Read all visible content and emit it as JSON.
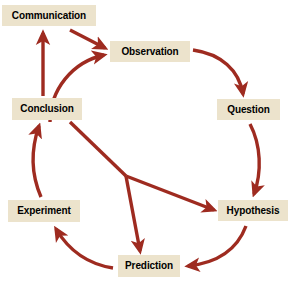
{
  "diagram": {
    "type": "cycle-flow-diagram",
    "canvas": {
      "width": 291,
      "height": 288
    },
    "colors": {
      "background": "#ffffff",
      "node_fill": "#ece3cc",
      "node_text": "#000000",
      "arrow": "#9e2b20"
    },
    "nodes": [
      {
        "id": "communication",
        "label": "Communication",
        "x": 2,
        "y": 5,
        "width": 94,
        "height": 21
      },
      {
        "id": "observation",
        "label": "Observation",
        "x": 110,
        "y": 41,
        "width": 80,
        "height": 21
      },
      {
        "id": "question",
        "label": "Question",
        "x": 217,
        "y": 99,
        "width": 63,
        "height": 21
      },
      {
        "id": "hypothesis",
        "label": "Hypothesis",
        "x": 218,
        "y": 200,
        "width": 70,
        "height": 21
      },
      {
        "id": "prediction",
        "label": "Prediction",
        "x": 118,
        "y": 255,
        "width": 62,
        "height": 22
      },
      {
        "id": "experiment",
        "label": "Experiment",
        "x": 8,
        "y": 200,
        "width": 72,
        "height": 22
      },
      {
        "id": "conclusion",
        "label": "Conclusion",
        "x": 12,
        "y": 98,
        "width": 70,
        "height": 22
      }
    ],
    "edges": [
      {
        "id": "conclusion-to-communication",
        "from": "Conclusion",
        "to": "Communication",
        "style": "straight"
      },
      {
        "id": "communication-to-observation",
        "from": "Communication",
        "to": "Observation",
        "style": "straight"
      },
      {
        "id": "conclusion-to-observation",
        "from": "Conclusion",
        "to": "Observation",
        "style": "curved"
      },
      {
        "id": "observation-to-question",
        "from": "Observation",
        "to": "Question",
        "style": "curved"
      },
      {
        "id": "question-to-hypothesis",
        "from": "Question",
        "to": "Hypothesis",
        "style": "curved"
      },
      {
        "id": "hypothesis-to-prediction",
        "from": "Hypothesis",
        "to": "Prediction",
        "style": "curved"
      },
      {
        "id": "prediction-to-experiment",
        "from": "Prediction",
        "to": "Experiment",
        "style": "curved"
      },
      {
        "id": "experiment-to-conclusion",
        "from": "Experiment",
        "to": "Conclusion",
        "style": "curved"
      },
      {
        "id": "conclusion-to-hypothesis",
        "from": "Conclusion",
        "to": "Hypothesis",
        "style": "branched"
      },
      {
        "id": "conclusion-to-prediction",
        "from": "Conclusion",
        "to": "Prediction",
        "style": "branched"
      }
    ]
  }
}
